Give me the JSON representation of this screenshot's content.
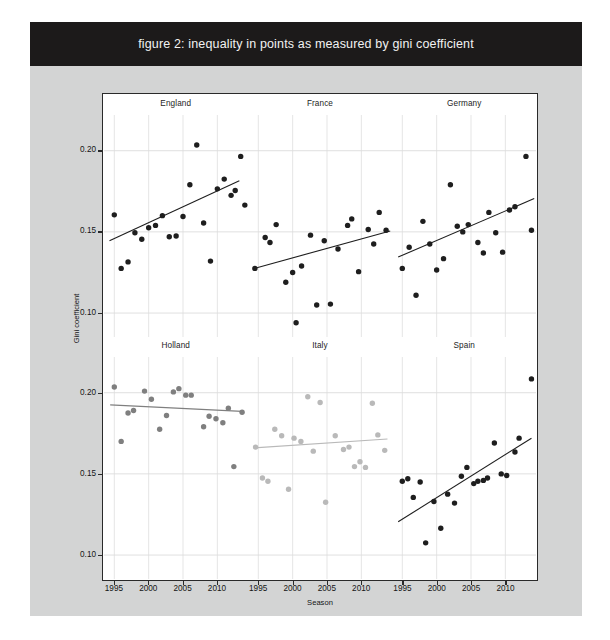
{
  "figure": {
    "title": "figure 2: inequality in points as measured by gini coefficient",
    "banner_color": "#1c1a1a",
    "canvas_color": "#d3d4d4"
  },
  "axes": {
    "ylabel": "Gini coefficient",
    "xlabel": "Season",
    "yticks": [
      "0.10",
      "0.15",
      "0.20"
    ],
    "xticks": [
      "1995",
      "2000",
      "2005",
      "2010"
    ]
  },
  "chart_data": {
    "type": "scatter",
    "title": "figure 2: inequality in points as measured by gini coefficient",
    "xlabel": "Season",
    "ylabel": "Gini coefficient",
    "xlim": [
      1993.5,
      2014.5
    ],
    "ylim": [
      0.085,
      0.222
    ],
    "xticks": [
      1995,
      2000,
      2005,
      2010
    ],
    "yticks": [
      0.1,
      0.15,
      0.2
    ],
    "grid": true,
    "legend": "none",
    "layout": "3 columns x 2 rows of small-multiple panels",
    "panels": [
      {
        "name": "England",
        "row": 0,
        "col": 0,
        "point_color": "#1e1e1e",
        "line_color": "#1e1e1e",
        "trend": {
          "x0": 1994.3,
          "y0": 0.1445,
          "x1": 2013.2,
          "y1": 0.1815
        },
        "points": [
          {
            "x": 1995.0,
            "y": 0.1605
          },
          {
            "x": 1996.0,
            "y": 0.1275
          },
          {
            "x": 1997.0,
            "y": 0.1315
          },
          {
            "x": 1998.0,
            "y": 0.1495
          },
          {
            "x": 1999.0,
            "y": 0.1455
          },
          {
            "x": 2000.0,
            "y": 0.1525
          },
          {
            "x": 2001.0,
            "y": 0.154
          },
          {
            "x": 2002.0,
            "y": 0.16
          },
          {
            "x": 2003.0,
            "y": 0.147
          },
          {
            "x": 2004.0,
            "y": 0.1475
          },
          {
            "x": 2005.0,
            "y": 0.1595
          },
          {
            "x": 2006.0,
            "y": 0.179
          },
          {
            "x": 2007.0,
            "y": 0.2035
          },
          {
            "x": 2008.0,
            "y": 0.1555
          },
          {
            "x": 2009.0,
            "y": 0.132
          },
          {
            "x": 2010.0,
            "y": 0.1765
          },
          {
            "x": 2011.0,
            "y": 0.1825
          },
          {
            "x": 2012.0,
            "y": 0.1725
          },
          {
            "x": 2012.6,
            "y": 0.1755
          },
          {
            "x": 2013.4,
            "y": 0.1965
          },
          {
            "x": 2014.0,
            "y": 0.1665
          }
        ]
      },
      {
        "name": "France",
        "row": 0,
        "col": 1,
        "point_color": "#1e1e1e",
        "line_color": "#1e1e1e",
        "trend": {
          "x0": 1994.4,
          "y0": 0.1275,
          "x1": 2014.2,
          "y1": 0.1505
        },
        "points": [
          {
            "x": 1994.5,
            "y": 0.1275
          },
          {
            "x": 1996.0,
            "y": 0.1465
          },
          {
            "x": 1996.7,
            "y": 0.1435
          },
          {
            "x": 1997.6,
            "y": 0.1545
          },
          {
            "x": 1999.0,
            "y": 0.119
          },
          {
            "x": 2000.0,
            "y": 0.125
          },
          {
            "x": 2000.5,
            "y": 0.094
          },
          {
            "x": 2001.3,
            "y": 0.129
          },
          {
            "x": 2002.6,
            "y": 0.148
          },
          {
            "x": 2003.5,
            "y": 0.105
          },
          {
            "x": 2004.6,
            "y": 0.1445
          },
          {
            "x": 2005.5,
            "y": 0.1055
          },
          {
            "x": 2006.6,
            "y": 0.1395
          },
          {
            "x": 2008.0,
            "y": 0.154
          },
          {
            "x": 2008.6,
            "y": 0.158
          },
          {
            "x": 2009.6,
            "y": 0.1255
          },
          {
            "x": 2011.0,
            "y": 0.1515
          },
          {
            "x": 2011.8,
            "y": 0.1425
          },
          {
            "x": 2012.6,
            "y": 0.162
          },
          {
            "x": 2013.6,
            "y": 0.151
          }
        ]
      },
      {
        "name": "Germany",
        "row": 0,
        "col": 2,
        "point_color": "#1e1e1e",
        "line_color": "#1e1e1e",
        "trend": {
          "x0": 1994.4,
          "y0": 0.1345,
          "x1": 2014.2,
          "y1": 0.1705
        },
        "points": [
          {
            "x": 1995.0,
            "y": 0.1275
          },
          {
            "x": 1996.0,
            "y": 0.1405
          },
          {
            "x": 1997.0,
            "y": 0.111
          },
          {
            "x": 1998.0,
            "y": 0.1565
          },
          {
            "x": 1999.0,
            "y": 0.1425
          },
          {
            "x": 2000.0,
            "y": 0.1265
          },
          {
            "x": 2001.0,
            "y": 0.1335
          },
          {
            "x": 2002.0,
            "y": 0.179
          },
          {
            "x": 2003.0,
            "y": 0.1535
          },
          {
            "x": 2003.8,
            "y": 0.15
          },
          {
            "x": 2004.6,
            "y": 0.1545
          },
          {
            "x": 2006.0,
            "y": 0.1435
          },
          {
            "x": 2006.8,
            "y": 0.137
          },
          {
            "x": 2007.6,
            "y": 0.162
          },
          {
            "x": 2008.6,
            "y": 0.1495
          },
          {
            "x": 2009.6,
            "y": 0.1375
          },
          {
            "x": 2010.6,
            "y": 0.1635
          },
          {
            "x": 2011.4,
            "y": 0.1655
          },
          {
            "x": 2013.0,
            "y": 0.1965
          },
          {
            "x": 2013.8,
            "y": 0.151
          }
        ]
      },
      {
        "name": "Holland",
        "row": 1,
        "col": 0,
        "point_color": "#7f7f7f",
        "line_color": "#7f7f7f",
        "trend": {
          "x0": 1994.4,
          "y0": 0.1925,
          "x1": 2013.6,
          "y1": 0.1885
        },
        "points": [
          {
            "x": 1995.0,
            "y": 0.2035
          },
          {
            "x": 1996.0,
            "y": 0.17
          },
          {
            "x": 1997.0,
            "y": 0.1875
          },
          {
            "x": 1997.8,
            "y": 0.189
          },
          {
            "x": 1999.4,
            "y": 0.201
          },
          {
            "x": 2000.4,
            "y": 0.196
          },
          {
            "x": 2001.6,
            "y": 0.1775
          },
          {
            "x": 2002.6,
            "y": 0.186
          },
          {
            "x": 2003.6,
            "y": 0.2005
          },
          {
            "x": 2004.4,
            "y": 0.2025
          },
          {
            "x": 2005.4,
            "y": 0.1985
          },
          {
            "x": 2006.2,
            "y": 0.1985
          },
          {
            "x": 2007.0,
            "y": 0.226
          },
          {
            "x": 2008.0,
            "y": 0.179
          },
          {
            "x": 2008.8,
            "y": 0.1855
          },
          {
            "x": 2009.8,
            "y": 0.184
          },
          {
            "x": 2010.8,
            "y": 0.1815
          },
          {
            "x": 2011.6,
            "y": 0.1905
          },
          {
            "x": 2012.4,
            "y": 0.1545
          },
          {
            "x": 2013.6,
            "y": 0.188
          }
        ]
      },
      {
        "name": "Italy",
        "row": 1,
        "col": 1,
        "point_color": "#b9b9b9",
        "line_color": "#b9b9b9",
        "trend": {
          "x0": 1994.4,
          "y0": 0.166,
          "x1": 2013.8,
          "y1": 0.1715
        },
        "points": [
          {
            "x": 1994.6,
            "y": 0.1665
          },
          {
            "x": 1995.6,
            "y": 0.1475
          },
          {
            "x": 1996.4,
            "y": 0.1455
          },
          {
            "x": 1997.4,
            "y": 0.1775
          },
          {
            "x": 1998.4,
            "y": 0.1735
          },
          {
            "x": 1999.4,
            "y": 0.1405
          },
          {
            "x": 2000.2,
            "y": 0.172
          },
          {
            "x": 2001.2,
            "y": 0.17
          },
          {
            "x": 2002.2,
            "y": 0.1975
          },
          {
            "x": 2003.0,
            "y": 0.164
          },
          {
            "x": 2004.0,
            "y": 0.194
          },
          {
            "x": 2004.8,
            "y": 0.1325
          },
          {
            "x": 2006.2,
            "y": 0.1735
          },
          {
            "x": 2007.4,
            "y": 0.165
          },
          {
            "x": 2008.2,
            "y": 0.1665
          },
          {
            "x": 2009.0,
            "y": 0.1545
          },
          {
            "x": 2009.8,
            "y": 0.1575
          },
          {
            "x": 2010.6,
            "y": 0.154
          },
          {
            "x": 2011.6,
            "y": 0.1935
          },
          {
            "x": 2012.4,
            "y": 0.174
          },
          {
            "x": 2013.4,
            "y": 0.1645
          }
        ]
      },
      {
        "name": "Spain",
        "row": 1,
        "col": 2,
        "point_color": "#1e1e1e",
        "line_color": "#1e1e1e",
        "trend": {
          "x0": 1994.4,
          "y0": 0.1205,
          "x1": 2013.8,
          "y1": 0.172
        },
        "points": [
          {
            "x": 1995.0,
            "y": 0.1455
          },
          {
            "x": 1995.8,
            "y": 0.147
          },
          {
            "x": 1996.6,
            "y": 0.1355
          },
          {
            "x": 1997.6,
            "y": 0.145
          },
          {
            "x": 1998.4,
            "y": 0.1075
          },
          {
            "x": 1999.6,
            "y": 0.133
          },
          {
            "x": 2000.6,
            "y": 0.1165
          },
          {
            "x": 2001.6,
            "y": 0.1375
          },
          {
            "x": 2002.6,
            "y": 0.132
          },
          {
            "x": 2003.6,
            "y": 0.1485
          },
          {
            "x": 2004.4,
            "y": 0.154
          },
          {
            "x": 2005.4,
            "y": 0.144
          },
          {
            "x": 2006.0,
            "y": 0.1455
          },
          {
            "x": 2006.8,
            "y": 0.146
          },
          {
            "x": 2007.4,
            "y": 0.1475
          },
          {
            "x": 2008.4,
            "y": 0.169
          },
          {
            "x": 2009.4,
            "y": 0.15
          },
          {
            "x": 2010.2,
            "y": 0.149
          },
          {
            "x": 2011.4,
            "y": 0.1635
          },
          {
            "x": 2012.0,
            "y": 0.172
          },
          {
            "x": 2013.8,
            "y": 0.2085
          }
        ]
      }
    ]
  }
}
